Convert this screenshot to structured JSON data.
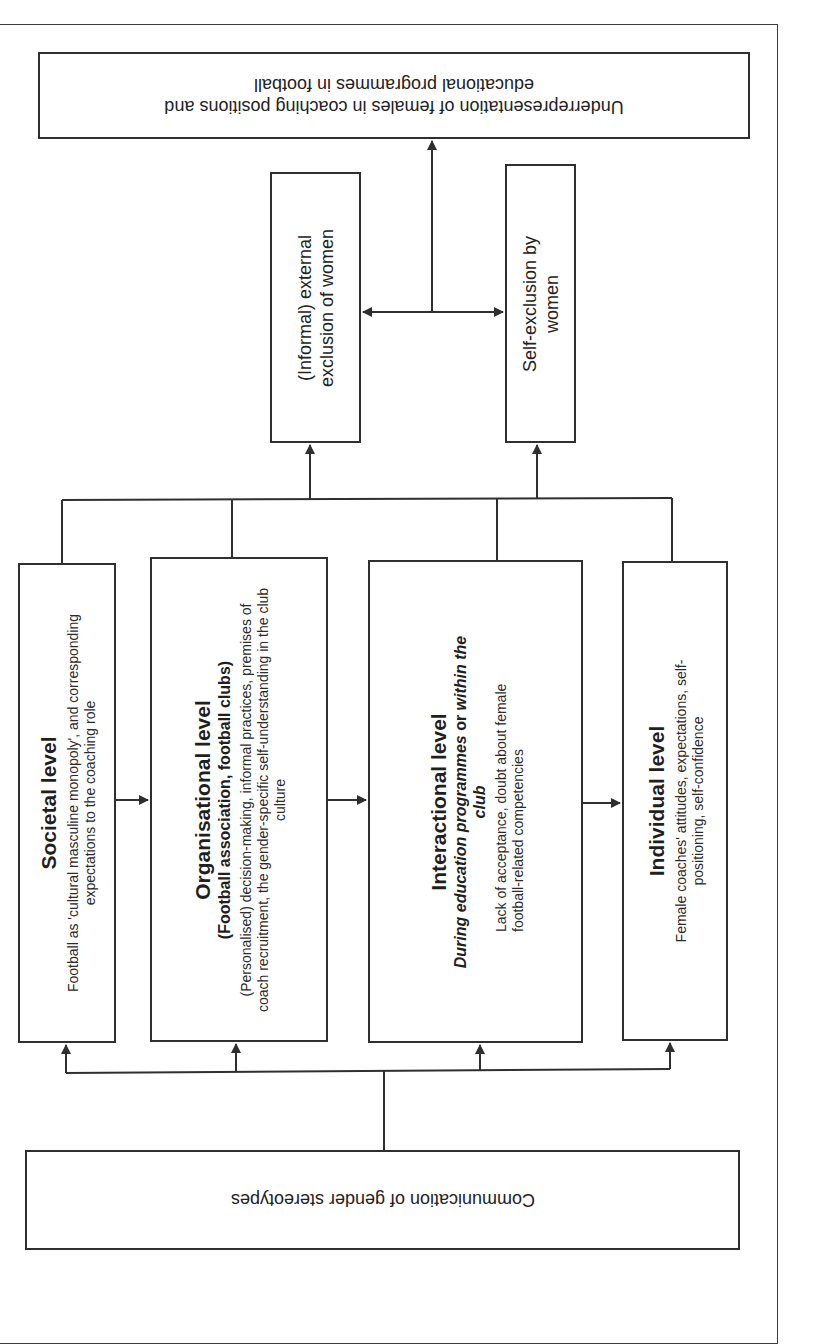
{
  "diagram": {
    "orientation": "rotated-180-and-90",
    "outcome": {
      "text_line1": "Underrepresentation of females in coaching positions and",
      "text_line2": "educational programmes in football"
    },
    "exclusion": {
      "external": {
        "line1": "(Informal) external",
        "line2": "exclusion of women"
      },
      "self": {
        "line1": "Self-exclusion by",
        "line2": "women"
      }
    },
    "levels": [
      {
        "title": "Societal level",
        "body": "Football as 'cultural masculine monopoly', and corresponding expectations to the coaching role"
      },
      {
        "title": "Organisational level",
        "subtitle": "(Football association, football clubs)",
        "body": "(Personalised) decision-making, informal practices, premises of coach recruitment, the gender-specific self-understanding in the club culture"
      },
      {
        "title": "Interactional level",
        "subtitle_italic": "During education programmes or within the club",
        "subtitle_part1": "During education programmes",
        "subtitle_or": " or ",
        "subtitle_part2": "within the club",
        "body": "Lack of acceptance, doubt about female football-related competencies"
      },
      {
        "title": "Individual level",
        "body": "Female coaches' attitudes, expectations, self-positioning, self-confidence"
      }
    ],
    "source": {
      "text": "Communication of gender stereotypes"
    },
    "colors": {
      "line": "#2f2f2f",
      "text": "#1f1f1f",
      "background": "#ffffff"
    }
  }
}
